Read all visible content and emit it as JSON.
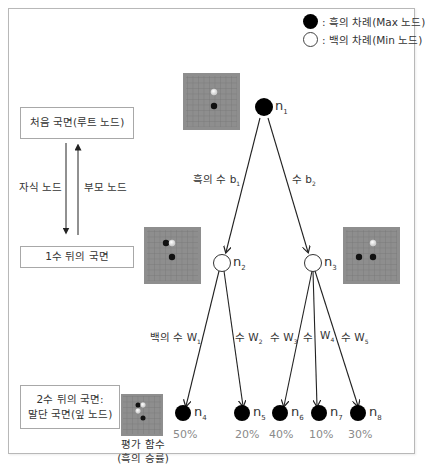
{
  "legend": {
    "black": ": 흑의 차례(Max 노드)",
    "white": ": 백의 차례(Min 노드)"
  },
  "levels": {
    "root": "처음 국면(루트 노드)",
    "level1": "1수 뒤의 국면",
    "level2_line1": "2수 뒤의 국면:",
    "level2_line2": "말단 국면(잎 노드)"
  },
  "direction": {
    "child": "자식 노드",
    "parent": "부모 노드"
  },
  "edges": {
    "b1": "흑의 수 b",
    "b1_sub": "1",
    "b2": "수 b",
    "b2_sub": "2",
    "w1": "백의 수 W",
    "w1_sub": "1",
    "w2": "수 W",
    "w2_sub": "2",
    "w3": "수 W",
    "w3_sub": "3",
    "w4": "수",
    "w4b": "W",
    "w4_sub": "4",
    "w5": "수 W",
    "w5_sub": "5"
  },
  "nodes": {
    "n1": {
      "label": "n",
      "sub": "1",
      "type": "black"
    },
    "n2": {
      "label": "n",
      "sub": "2",
      "type": "white"
    },
    "n3": {
      "label": "n",
      "sub": "3",
      "type": "white"
    },
    "n4": {
      "label": "n",
      "sub": "4",
      "type": "black",
      "value": "50%"
    },
    "n5": {
      "label": "n",
      "sub": "5",
      "type": "black",
      "value": "20%"
    },
    "n6": {
      "label": "n",
      "sub": "6",
      "type": "black",
      "value": "40%"
    },
    "n7": {
      "label": "n",
      "sub": "7",
      "type": "black",
      "value": "10%"
    },
    "n8": {
      "label": "n",
      "sub": "8",
      "type": "black",
      "value": "30%"
    }
  },
  "eval": {
    "line1": "평가 함수",
    "line2": "(흑의 승률)"
  },
  "colors": {
    "board": "#8c8c8c",
    "grid": "#6e6e6e",
    "border": "#a8a8a8",
    "value_text": "#8a8a8a"
  }
}
